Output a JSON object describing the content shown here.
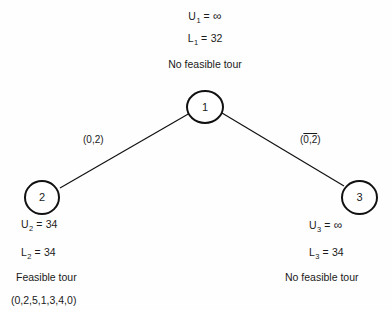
{
  "diagram": {
    "background_color": "#fefefe",
    "line_color": "#111111"
  },
  "nodes": [
    {
      "id": "node-1",
      "label": "1"
    },
    {
      "id": "node-2",
      "label": "2"
    },
    {
      "id": "node-3",
      "label": "3"
    }
  ],
  "edges": [
    {
      "id": "edge-1-2",
      "label_prefix": "(",
      "label_body": "0,2",
      "label_suffix": ")",
      "overline": false
    },
    {
      "id": "edge-1-3",
      "label_prefix": "(",
      "label_body": "0,2",
      "label_suffix": ")",
      "overline": true
    }
  ],
  "annotations": {
    "root": {
      "upper_bound_var": "U",
      "upper_bound_sub": "1",
      "upper_bound_eq": "=",
      "upper_bound_value": "∞",
      "lower_bound_var": "L",
      "lower_bound_sub": "1",
      "lower_bound_eq": "=",
      "lower_bound_value": "32",
      "status": "No feasible tour"
    },
    "left": {
      "upper_bound_var": "U",
      "upper_bound_sub": "2",
      "upper_bound_eq": "=",
      "upper_bound_value": "34",
      "lower_bound_var": "L",
      "lower_bound_sub": "2",
      "lower_bound_eq": "=",
      "lower_bound_value": "34",
      "status": "Feasible tour",
      "tour": "(0,2,5,1,3,4,0)"
    },
    "right": {
      "upper_bound_var": "U",
      "upper_bound_sub": "3",
      "upper_bound_eq": "=",
      "upper_bound_value": "∞",
      "lower_bound_var": "L",
      "lower_bound_sub": "3",
      "lower_bound_eq": "=",
      "lower_bound_value": "34",
      "status": "No feasible tour"
    }
  }
}
